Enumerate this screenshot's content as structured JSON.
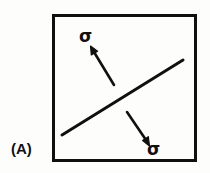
{
  "figure": {
    "panel_label": "(A)",
    "background_color": "#fdfdfc",
    "ink_color": "#101010",
    "frame": {
      "name": "rectangular-border",
      "x": 52,
      "y": 14,
      "width": 145,
      "height": 148,
      "stroke_width": 3
    },
    "fault_line": {
      "name": "inclined-plane-line",
      "x1": 62,
      "y1": 135,
      "x2": 183,
      "y2": 60,
      "stroke_width": 3
    },
    "arrows": [
      {
        "name": "stress-arrow-upper-left",
        "label": "σ",
        "direction": "up-left",
        "x1": 114,
        "y1": 85,
        "x2": 91,
        "y2": 47
      },
      {
        "name": "stress-arrow-lower-right",
        "label": "σ",
        "direction": "down-right",
        "x1": 127,
        "y1": 112,
        "x2": 149,
        "y2": 145
      }
    ],
    "labels": {
      "sigma_top": "σ",
      "sigma_bottom": "σ"
    }
  }
}
